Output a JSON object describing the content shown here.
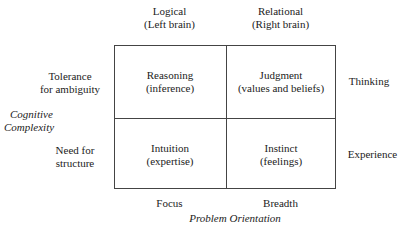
{
  "columns": [
    {
      "line1": "Logical",
      "line2": "(Left brain)"
    },
    {
      "line1": "Relational",
      "line2": "(Right brain)"
    }
  ],
  "rows_left": [
    {
      "line1": "Tolerance",
      "line2": "for ambiguity"
    },
    {
      "line1": "Need for",
      "line2": "structure"
    }
  ],
  "rows_right": [
    "Thinking",
    "Experience"
  ],
  "cells": [
    {
      "line1": "Reasoning",
      "line2": "(inference)"
    },
    {
      "line1": "Judgment",
      "line2": "(values and beliefs)"
    },
    {
      "line1": "Intuition",
      "line2": "(expertise)"
    },
    {
      "line1": "Instinct",
      "line2": "(feelings)"
    }
  ],
  "bottom_labels": [
    "Focus",
    "Breadth"
  ],
  "y_axis_title": {
    "line1": "Cognitive",
    "line2": "Complexity"
  },
  "x_axis_title": "Problem Orientation"
}
